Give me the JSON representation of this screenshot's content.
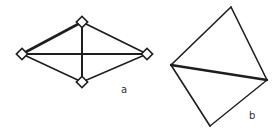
{
  "figures": [
    {
      "id": "a",
      "label": "a",
      "label_pos": [
        124,
        92
      ],
      "vertices": {
        "top": [
          82,
          22
        ],
        "left": [
          22,
          54
        ],
        "right": [
          147,
          54
        ],
        "bottom": [
          82,
          82
        ]
      },
      "vertex_markers": "hollow-diamond",
      "edges": [
        {
          "from": "left",
          "to": "top",
          "weight": 2.6
        },
        {
          "from": "top",
          "to": "right",
          "weight": 1.8
        },
        {
          "from": "right",
          "to": "bottom",
          "weight": 1.4
        },
        {
          "from": "bottom",
          "to": "left",
          "weight": 1.6
        },
        {
          "from": "left",
          "to": "right",
          "weight": 2.2
        },
        {
          "from": "top",
          "to": "bottom",
          "weight": 2.0
        }
      ]
    },
    {
      "id": "b",
      "label": "b",
      "label_pos": [
        251,
        118
      ],
      "vertices": {
        "top": [
          231,
          7
        ],
        "left": [
          171,
          65
        ],
        "right": [
          267,
          80
        ],
        "bottom": [
          210,
          126
        ]
      },
      "vertex_markers": "none",
      "edges": [
        {
          "from": "left",
          "to": "top",
          "weight": 1.6
        },
        {
          "from": "top",
          "to": "right",
          "weight": 1.6
        },
        {
          "from": "right",
          "to": "bottom",
          "weight": 1.4
        },
        {
          "from": "bottom",
          "to": "left",
          "weight": 1.6
        },
        {
          "from": "left",
          "to": "right",
          "weight": 2.4
        }
      ]
    }
  ],
  "colors": {
    "stroke": "#1e1e1e",
    "background": "#ffffff"
  }
}
